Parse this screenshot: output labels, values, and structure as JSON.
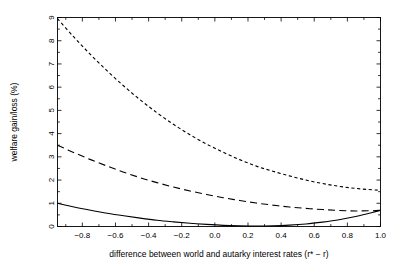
{
  "chart_data": {
    "type": "line",
    "title": "",
    "xlabel": "difference between world and autarky interest rates (r* − r)",
    "ylabel": "welfare gain/loss (%)",
    "xlim": [
      -0.95,
      1.0
    ],
    "ylim": [
      0,
      9
    ],
    "grid": false,
    "legend": "none",
    "xticks": [
      -0.8,
      -0.6,
      -0.4,
      -0.2,
      0.0,
      0.2,
      0.4,
      0.6,
      0.8,
      1.0
    ],
    "xticklabels": [
      "−0.8",
      "−0.6",
      "−0.4",
      "−0.2",
      "0.0",
      "0.2",
      "0.4",
      "0.6",
      "0.8",
      "1.0"
    ],
    "yticks": [
      0,
      1,
      2,
      3,
      4,
      5,
      6,
      7,
      8,
      9
    ],
    "yticklabels": [
      "0",
      "1",
      "2",
      "3",
      "4",
      "5",
      "6",
      "7",
      "8",
      "9"
    ],
    "x": [
      -0.95,
      -0.85,
      -0.75,
      -0.65,
      -0.55,
      -0.45,
      -0.35,
      -0.25,
      -0.15,
      -0.05,
      0.05,
      0.15,
      0.25,
      0.35,
      0.45,
      0.55,
      0.65,
      0.75,
      0.85,
      0.95,
      1.0
    ],
    "series": [
      {
        "name": "dotted-curve",
        "style": "dotted",
        "values": [
          8.95,
          8.15,
          7.4,
          6.7,
          6.05,
          5.45,
          4.9,
          4.4,
          3.95,
          3.55,
          3.2,
          2.88,
          2.6,
          2.38,
          2.18,
          2.0,
          1.85,
          1.73,
          1.64,
          1.58,
          1.56
        ]
      },
      {
        "name": "dashed-curve",
        "style": "dashed",
        "values": [
          3.5,
          3.18,
          2.88,
          2.6,
          2.34,
          2.1,
          1.89,
          1.7,
          1.53,
          1.38,
          1.24,
          1.12,
          1.01,
          0.92,
          0.84,
          0.78,
          0.73,
          0.69,
          0.67,
          0.68,
          0.7
        ]
      },
      {
        "name": "solid-curve",
        "style": "solid",
        "values": [
          1.0,
          0.84,
          0.7,
          0.57,
          0.46,
          0.36,
          0.27,
          0.2,
          0.14,
          0.09,
          0.05,
          0.03,
          0.02,
          0.03,
          0.06,
          0.11,
          0.19,
          0.29,
          0.43,
          0.6,
          0.7
        ]
      }
    ]
  }
}
